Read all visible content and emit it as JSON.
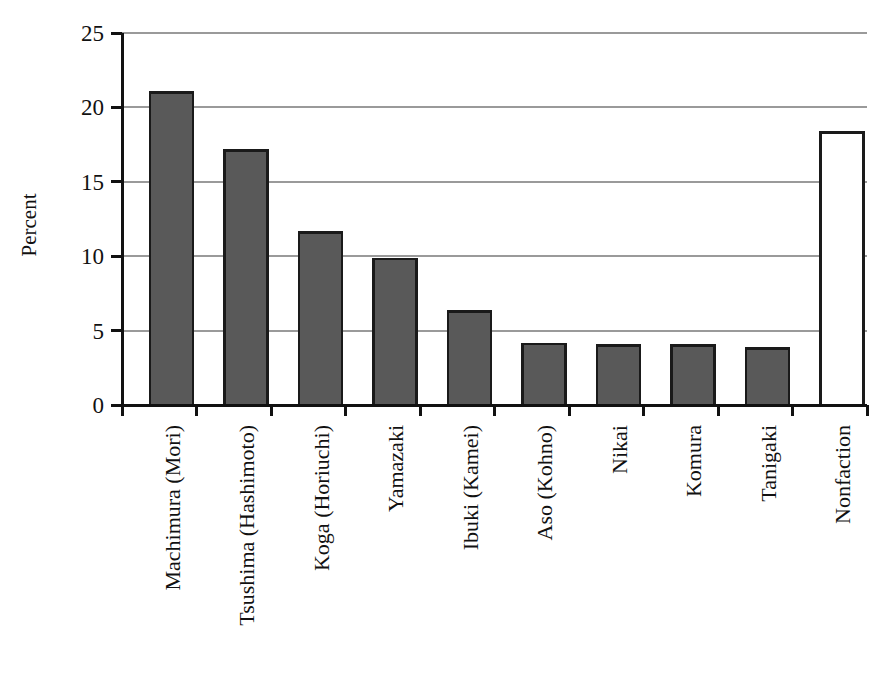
{
  "chart_data": {
    "type": "bar",
    "title": "",
    "subtitle": "",
    "xlabel": "",
    "ylabel": "Percent",
    "ylim": [
      0,
      25
    ],
    "yticks": [
      0,
      5,
      10,
      15,
      20,
      25
    ],
    "ytick_labels": [
      "0",
      "5",
      "10",
      "15",
      "20",
      "25"
    ],
    "grid": true,
    "grid_axis": "y",
    "legend": "none",
    "categories": [
      "Machimura (Mori)",
      "Tsushima (Hashimoto)",
      "Koga (Horiuchi)",
      "Yamazaki",
      "Ibuki (Kamei)",
      "Aso (Kohno)",
      "Nikai",
      "Komura",
      "Tanigaki",
      "Nonfaction"
    ],
    "values": [
      21.0,
      17.1,
      11.6,
      9.8,
      6.3,
      4.1,
      4.0,
      4.0,
      3.8,
      18.3
    ],
    "bar_styles": [
      "filled",
      "filled",
      "filled",
      "filled",
      "filled",
      "filled",
      "filled",
      "filled",
      "filled",
      "hollow"
    ]
  },
  "style": {
    "bar_fill_color": "#595959",
    "bar_edge_color": "#1a1a1a",
    "hollow_fill_color": "#ffffff",
    "grid_color": "#9a9a9a",
    "axis_color": "#111111",
    "text_color": "#111111",
    "background_color": "#ffffff"
  },
  "geometry": {
    "plot_left": 122,
    "plot_right": 867,
    "plot_top": 33,
    "plot_bottom": 405,
    "bar_width": 43,
    "category_pitch": 74.5,
    "first_bar_left": 150,
    "label_baseline_y": 425,
    "y_title_x": 36,
    "y_title_y": 225
  }
}
